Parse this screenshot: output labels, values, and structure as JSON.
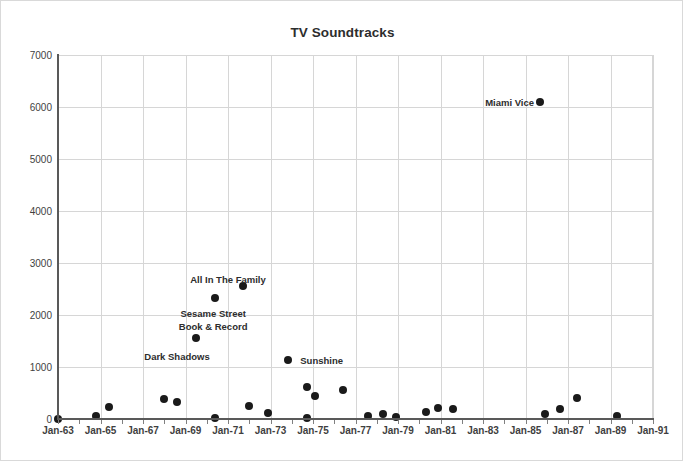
{
  "chart_data": {
    "type": "scatter",
    "title": "TV Soundtracks",
    "xlabel": "",
    "ylabel": "",
    "ylim": [
      0,
      7000
    ],
    "ytick_step": 1000,
    "yticks": [
      "0",
      "1000",
      "2000",
      "3000",
      "4000",
      "5000",
      "6000",
      "7000"
    ],
    "xlim": [
      "Jan-63",
      "Jan-91"
    ],
    "xticks": [
      "Jan-63",
      "Jan-65",
      "Jan-67",
      "Jan-69",
      "Jan-71",
      "Jan-73",
      "Jan-75",
      "Jan-77",
      "Jan-79",
      "Jan-81",
      "Jan-83",
      "Jan-85",
      "Jan-87",
      "Jan-89",
      "Jan-91"
    ],
    "grid": true,
    "legend": "none",
    "point_color": "#1a1a1a",
    "grid_color": "#d6d6d6",
    "axis_color": "#595959",
    "points": [
      {
        "label": "",
        "x_year": 1964.8,
        "value": 60
      },
      {
        "label": "",
        "x_year": 1965.4,
        "value": 230
      },
      {
        "label": "",
        "x_year": 1666.0,
        "value": 0
      },
      {
        "label": "",
        "x_year": 1968.0,
        "value": 390
      },
      {
        "label": "",
        "x_year": 1968.6,
        "value": 320
      },
      {
        "label": "Dark Shadows",
        "x_year": 1969.5,
        "value": 1560
      },
      {
        "label": "",
        "x_year": 1970.4,
        "value": 20
      },
      {
        "label": "All In The Family",
        "x_year": 1970.4,
        "value": 2320
      },
      {
        "label": "",
        "x_year": 1971.7,
        "value": 2550
      },
      {
        "label": "",
        "x_year": 1972.0,
        "value": 250
      },
      {
        "label": "",
        "x_year": 1972.9,
        "value": 120
      },
      {
        "label": "Sunshine",
        "x_year": 1973.8,
        "value": 1130
      },
      {
        "label": "",
        "x_year": 1974.7,
        "value": 620
      },
      {
        "label": "",
        "x_year": 1975.1,
        "value": 450
      },
      {
        "label": "",
        "x_year": 1974.7,
        "value": 20
      },
      {
        "label": "",
        "x_year": 1976.4,
        "value": 560
      },
      {
        "label": "",
        "x_year": 1977.6,
        "value": 60
      },
      {
        "label": "",
        "x_year": 1978.3,
        "value": 90
      },
      {
        "label": "",
        "x_year": 1978.9,
        "value": 30
      },
      {
        "label": "",
        "x_year": 1980.3,
        "value": 130
      },
      {
        "label": "",
        "x_year": 1980.9,
        "value": 210
      },
      {
        "label": "",
        "x_year": 1981.6,
        "value": 200
      },
      {
        "label": "Miami Vice",
        "x_year": 1985.7,
        "value": 6100
      },
      {
        "label": "",
        "x_year": 1985.9,
        "value": 90
      },
      {
        "label": "",
        "x_year": 1986.6,
        "value": 200
      },
      {
        "label": "",
        "x_year": 1987.4,
        "value": 400
      },
      {
        "label": "",
        "x_year": 1989.3,
        "value": 50
      }
    ],
    "annotations": [
      {
        "text": "All In The Family",
        "x_year": 1971.0,
        "value": 2790,
        "align": "center"
      },
      {
        "text": "Sesame Street",
        "x_year": 1970.3,
        "value": 2130,
        "align": "center"
      },
      {
        "text": "Book & Record",
        "x_year": 1970.3,
        "value": 1890,
        "align": "center"
      },
      {
        "text": "Dark Shadows",
        "x_year": 1968.6,
        "value": 1300,
        "align": "center"
      },
      {
        "text": "Sunshine",
        "x_year": 1974.4,
        "value": 1130,
        "align": "left"
      },
      {
        "text": "Miami Vice",
        "x_year": 1983.1,
        "value": 6100,
        "align": "left"
      }
    ]
  }
}
